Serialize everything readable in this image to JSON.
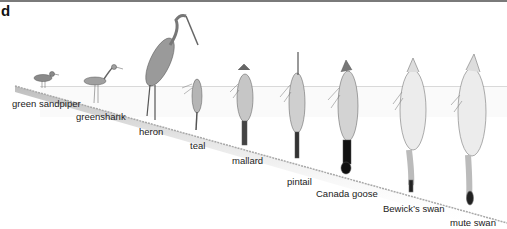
{
  "panel": {
    "label": "d"
  },
  "birds": [
    {
      "name": "green sandpiper",
      "x": 12,
      "y": 105
    },
    {
      "name": "greenshank",
      "x": 76,
      "y": 118
    },
    {
      "name": "heron",
      "x": 139,
      "y": 133
    },
    {
      "name": "teal",
      "x": 190,
      "y": 147
    },
    {
      "name": "mallard",
      "x": 232,
      "y": 162
    },
    {
      "name": "pintail",
      "x": 287,
      "y": 175
    },
    {
      "name": "Canada goose",
      "x": 316,
      "y": 188
    },
    {
      "name": "Bewick’s swan",
      "x": 383,
      "y": 203
    },
    {
      "name": "mute swan",
      "x": 450,
      "y": 217
    }
  ],
  "colors": {
    "water_line": "#d8d8d8",
    "bank": "#c9c9c9",
    "ink": "#555555"
  }
}
